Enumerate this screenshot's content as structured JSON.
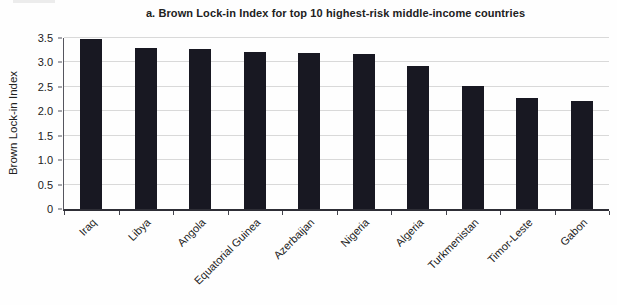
{
  "chart_data": {
    "type": "bar",
    "title": "a. Brown Lock-in Index for top 10 highest-risk middle-income countries",
    "xlabel": "",
    "ylabel": "Brown Lock-in Index",
    "categories": [
      "Iraq",
      "Libya",
      "Angola",
      "Equatorial Guinea",
      "Azerbaijan",
      "Nigeria",
      "Algeria",
      "Turkmenistan",
      "Timor-Leste",
      "Gabon"
    ],
    "values": [
      3.47,
      3.3,
      3.28,
      3.22,
      3.2,
      3.18,
      2.92,
      2.51,
      2.27,
      2.21
    ],
    "ylim": [
      0,
      3.5
    ],
    "ytick_labels": [
      "3.5",
      "3.0",
      "2.5",
      "2.0",
      "1.5",
      "1.0",
      "0.5",
      "0"
    ],
    "grid": true,
    "legend": false,
    "colors": {
      "bar": "#181822",
      "gridline": "#d9d9d9",
      "axis": "#44444c",
      "text": "#212121"
    }
  }
}
